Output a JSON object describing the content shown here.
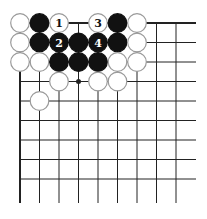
{
  "diagram": {
    "type": "go-board-fragment",
    "grid": {
      "origin_x": 20,
      "origin_y": 23,
      "spacing": 19.5,
      "cols": 9,
      "rows": 9,
      "right_extent": 196,
      "bottom_extent": 203
    },
    "star_points": [
      [
        3,
        3
      ]
    ],
    "stones": [
      {
        "col": 0,
        "row": 0,
        "color": "white",
        "label": ""
      },
      {
        "col": 1,
        "row": 0,
        "color": "black",
        "label": ""
      },
      {
        "col": 2,
        "row": 0,
        "color": "white",
        "label": "1"
      },
      {
        "col": 4,
        "row": 0,
        "color": "white",
        "label": "3"
      },
      {
        "col": 5,
        "row": 0,
        "color": "black",
        "label": ""
      },
      {
        "col": 6,
        "row": 0,
        "color": "white",
        "label": ""
      },
      {
        "col": 0,
        "row": 1,
        "color": "white",
        "label": ""
      },
      {
        "col": 1,
        "row": 1,
        "color": "black",
        "label": ""
      },
      {
        "col": 2,
        "row": 1,
        "color": "black",
        "label": "2"
      },
      {
        "col": 3,
        "row": 1,
        "color": "black",
        "label": ""
      },
      {
        "col": 4,
        "row": 1,
        "color": "black",
        "label": "4"
      },
      {
        "col": 5,
        "row": 1,
        "color": "black",
        "label": ""
      },
      {
        "col": 6,
        "row": 1,
        "color": "white",
        "label": ""
      },
      {
        "col": 0,
        "row": 2,
        "color": "white",
        "label": ""
      },
      {
        "col": 1,
        "row": 2,
        "color": "white",
        "label": ""
      },
      {
        "col": 2,
        "row": 2,
        "color": "black",
        "label": ""
      },
      {
        "col": 3,
        "row": 2,
        "color": "black",
        "label": ""
      },
      {
        "col": 4,
        "row": 2,
        "color": "black",
        "label": ""
      },
      {
        "col": 5,
        "row": 2,
        "color": "white",
        "label": ""
      },
      {
        "col": 6,
        "row": 2,
        "color": "white",
        "label": ""
      },
      {
        "col": 2,
        "row": 3,
        "color": "white",
        "label": ""
      },
      {
        "col": 4,
        "row": 3,
        "color": "white",
        "label": ""
      },
      {
        "col": 5,
        "row": 3,
        "color": "white",
        "label": ""
      },
      {
        "col": 1,
        "row": 4,
        "color": "white",
        "label": ""
      }
    ],
    "colors": {
      "line": "#222222",
      "black": "#111111",
      "white": "#ffffff",
      "white_edge": "#9a9a9a"
    }
  }
}
